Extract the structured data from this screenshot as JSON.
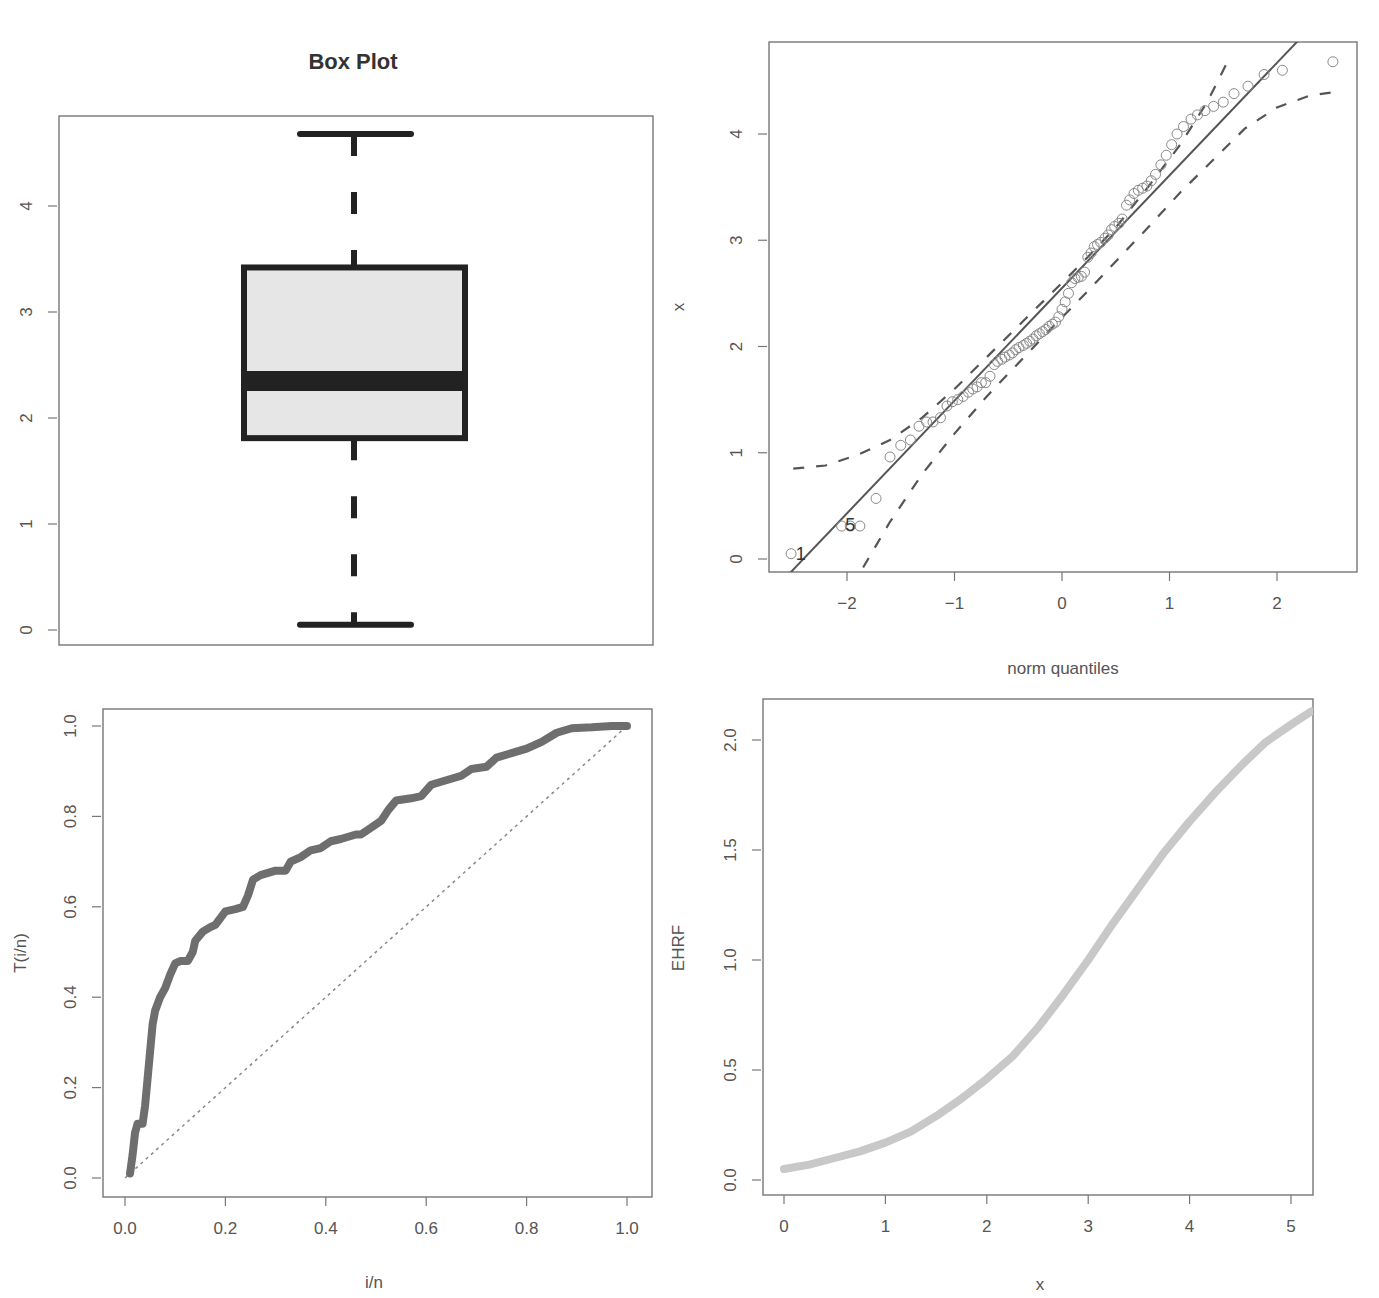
{
  "chart_data": [
    {
      "id": "boxplot",
      "type": "box",
      "title": "Box Plot",
      "xlabel": "",
      "ylabel": "",
      "ylim": [
        -0.1,
        4.9
      ],
      "yticks": [
        0,
        1,
        2,
        3,
        4
      ],
      "ytick_labels": [
        "0",
        "1",
        "2",
        "3",
        "4"
      ],
      "stats": {
        "min": 0.05,
        "q1": 1.81,
        "median": 2.35,
        "q3": 3.42,
        "max": 4.68
      },
      "box_fill": "#e6e6e6",
      "line_color": "#222222",
      "frame": {
        "x0": 59,
        "y0": 116,
        "x1": 653,
        "y1": 645
      },
      "map": {
        "y_px_at_0": 630,
        "px_per_unit": 106
      }
    },
    {
      "id": "qqplot",
      "type": "scatter",
      "title": "",
      "xlabel": "norm quantiles",
      "ylabel": "x",
      "xlim": [
        -2.7,
        2.75
      ],
      "ylim": [
        -0.12,
        4.85
      ],
      "xticks": [
        -2,
        -1,
        0,
        1,
        2
      ],
      "xtick_labels": [
        "−2",
        "−1",
        "0",
        "1",
        "2"
      ],
      "yticks": [
        0,
        1,
        2,
        3,
        4
      ],
      "ytick_labels": [
        "0",
        "1",
        "2",
        "3",
        "4"
      ],
      "point_labels": [
        {
          "text": "1",
          "x": -2.43,
          "y": 0.05
        },
        {
          "text": "5",
          "x": -1.97,
          "y": 0.32
        }
      ],
      "points": [
        [
          -2.52,
          0.05
        ],
        [
          -2.05,
          0.31
        ],
        [
          -1.97,
          0.31
        ],
        [
          -1.88,
          0.31
        ],
        [
          -1.73,
          0.57
        ],
        [
          -1.6,
          0.96
        ],
        [
          -1.5,
          1.07
        ],
        [
          -1.41,
          1.12
        ],
        [
          -1.33,
          1.25
        ],
        [
          -1.26,
          1.29
        ],
        [
          -1.2,
          1.29
        ],
        [
          -1.13,
          1.33
        ],
        [
          -1.07,
          1.44
        ],
        [
          -1.02,
          1.48
        ],
        [
          -0.97,
          1.5
        ],
        [
          -0.92,
          1.53
        ],
        [
          -0.87,
          1.57
        ],
        [
          -0.83,
          1.6
        ],
        [
          -0.79,
          1.62
        ],
        [
          -0.75,
          1.66
        ],
        [
          -0.71,
          1.66
        ],
        [
          -0.67,
          1.72
        ],
        [
          -0.63,
          1.83
        ],
        [
          -0.6,
          1.86
        ],
        [
          -0.56,
          1.88
        ],
        [
          -0.53,
          1.9
        ],
        [
          -0.49,
          1.92
        ],
        [
          -0.46,
          1.94
        ],
        [
          -0.43,
          1.97
        ],
        [
          -0.4,
          1.99
        ],
        [
          -0.36,
          2.01
        ],
        [
          -0.33,
          2.03
        ],
        [
          -0.3,
          2.05
        ],
        [
          -0.27,
          2.07
        ],
        [
          -0.24,
          2.1
        ],
        [
          -0.21,
          2.12
        ],
        [
          -0.18,
          2.14
        ],
        [
          -0.15,
          2.16
        ],
        [
          -0.12,
          2.19
        ],
        [
          -0.09,
          2.21
        ],
        [
          -0.06,
          2.23
        ],
        [
          -0.03,
          2.28
        ],
        [
          0.0,
          2.35
        ],
        [
          0.03,
          2.42
        ],
        [
          0.06,
          2.5
        ],
        [
          0.09,
          2.6
        ],
        [
          0.12,
          2.64
        ],
        [
          0.15,
          2.65
        ],
        [
          0.18,
          2.66
        ],
        [
          0.21,
          2.7
        ],
        [
          0.24,
          2.84
        ],
        [
          0.27,
          2.88
        ],
        [
          0.3,
          2.94
        ],
        [
          0.33,
          2.96
        ],
        [
          0.36,
          2.98
        ],
        [
          0.4,
          3.02
        ],
        [
          0.43,
          3.05
        ],
        [
          0.46,
          3.1
        ],
        [
          0.49,
          3.13
        ],
        [
          0.53,
          3.16
        ],
        [
          0.56,
          3.2
        ],
        [
          0.6,
          3.33
        ],
        [
          0.63,
          3.38
        ],
        [
          0.67,
          3.44
        ],
        [
          0.71,
          3.47
        ],
        [
          0.75,
          3.49
        ],
        [
          0.79,
          3.51
        ],
        [
          0.83,
          3.56
        ],
        [
          0.87,
          3.62
        ],
        [
          0.92,
          3.71
        ],
        [
          0.97,
          3.8
        ],
        [
          1.02,
          3.9
        ],
        [
          1.07,
          4.0
        ],
        [
          1.13,
          4.07
        ],
        [
          1.2,
          4.14
        ],
        [
          1.26,
          4.18
        ],
        [
          1.33,
          4.22
        ],
        [
          1.41,
          4.26
        ],
        [
          1.5,
          4.3
        ],
        [
          1.6,
          4.38
        ],
        [
          1.73,
          4.45
        ],
        [
          1.88,
          4.56
        ],
        [
          2.05,
          4.6
        ],
        [
          2.52,
          4.68
        ]
      ],
      "fit_line": {
        "intercept": 2.55,
        "slope": 1.06
      },
      "upper_band": [
        [
          -2.5,
          0.85
        ],
        [
          -2.2,
          0.88
        ],
        [
          -1.9,
          0.98
        ],
        [
          -1.6,
          1.12
        ],
        [
          -1.3,
          1.33
        ],
        [
          -1.0,
          1.6
        ],
        [
          -0.7,
          1.9
        ],
        [
          -0.4,
          2.2
        ],
        [
          -0.1,
          2.5
        ],
        [
          0.2,
          2.8
        ],
        [
          0.5,
          3.12
        ],
        [
          0.8,
          3.5
        ],
        [
          1.1,
          3.9
        ],
        [
          1.35,
          4.3
        ],
        [
          1.55,
          4.7
        ]
      ],
      "lower_band": [
        [
          -1.85,
          -0.08
        ],
        [
          -1.6,
          0.35
        ],
        [
          -1.3,
          0.8
        ],
        [
          -1.0,
          1.18
        ],
        [
          -0.7,
          1.53
        ],
        [
          -0.4,
          1.85
        ],
        [
          -0.1,
          2.17
        ],
        [
          0.2,
          2.48
        ],
        [
          0.5,
          2.8
        ],
        [
          0.8,
          3.12
        ],
        [
          1.1,
          3.45
        ],
        [
          1.4,
          3.75
        ],
        [
          1.7,
          4.05
        ],
        [
          2.0,
          4.25
        ],
        [
          2.3,
          4.36
        ],
        [
          2.5,
          4.39
        ]
      ],
      "frame": {
        "x0": 769,
        "y0": 42,
        "x1": 1357,
        "y1": 572
      },
      "map": {
        "x_px_at_0": 1062,
        "x_px_per_unit": 107.5,
        "y_px_at_0": 559,
        "y_px_per_unit": 106.25
      }
    },
    {
      "id": "lorenz",
      "type": "line",
      "title": "",
      "xlabel": "i/n",
      "ylabel": "T(i/n)",
      "xlim": [
        -0.04,
        1.04
      ],
      "ylim": [
        -0.04,
        1.04
      ],
      "xticks": [
        0.0,
        0.2,
        0.4,
        0.6,
        0.8,
        1.0
      ],
      "xtick_labels": [
        "0.0",
        "0.2",
        "0.4",
        "0.6",
        "0.8",
        "1.0"
      ],
      "yticks": [
        0.0,
        0.2,
        0.4,
        0.6,
        0.8,
        1.0
      ],
      "ytick_labels": [
        "0.0",
        "0.2",
        "0.4",
        "0.6",
        "0.8",
        "1.0"
      ],
      "series": [
        {
          "name": "T(i/n)",
          "color": "#6e6e6e",
          "points": [
            [
              0.01,
              0.01
            ],
            [
              0.015,
              0.05
            ],
            [
              0.02,
              0.1
            ],
            [
              0.025,
              0.12
            ],
            [
              0.035,
              0.12
            ],
            [
              0.04,
              0.16
            ],
            [
              0.045,
              0.22
            ],
            [
              0.05,
              0.28
            ],
            [
              0.055,
              0.34
            ],
            [
              0.06,
              0.37
            ],
            [
              0.07,
              0.4
            ],
            [
              0.08,
              0.42
            ],
            [
              0.09,
              0.45
            ],
            [
              0.1,
              0.475
            ],
            [
              0.11,
              0.48
            ],
            [
              0.125,
              0.48
            ],
            [
              0.135,
              0.5
            ],
            [
              0.14,
              0.525
            ],
            [
              0.155,
              0.545
            ],
            [
              0.17,
              0.555
            ],
            [
              0.18,
              0.56
            ],
            [
              0.19,
              0.575
            ],
            [
              0.2,
              0.59
            ],
            [
              0.22,
              0.595
            ],
            [
              0.235,
              0.6
            ],
            [
              0.245,
              0.625
            ],
            [
              0.255,
              0.66
            ],
            [
              0.27,
              0.67
            ],
            [
              0.3,
              0.68
            ],
            [
              0.32,
              0.68
            ],
            [
              0.33,
              0.7
            ],
            [
              0.35,
              0.71
            ],
            [
              0.37,
              0.725
            ],
            [
              0.39,
              0.73
            ],
            [
              0.41,
              0.745
            ],
            [
              0.43,
              0.75
            ],
            [
              0.46,
              0.76
            ],
            [
              0.47,
              0.76
            ],
            [
              0.49,
              0.775
            ],
            [
              0.51,
              0.79
            ],
            [
              0.525,
              0.815
            ],
            [
              0.54,
              0.835
            ],
            [
              0.57,
              0.84
            ],
            [
              0.59,
              0.845
            ],
            [
              0.61,
              0.87
            ],
            [
              0.64,
              0.88
            ],
            [
              0.67,
              0.89
            ],
            [
              0.69,
              0.905
            ],
            [
              0.72,
              0.91
            ],
            [
              0.74,
              0.93
            ],
            [
              0.77,
              0.94
            ],
            [
              0.8,
              0.95
            ],
            [
              0.83,
              0.965
            ],
            [
              0.86,
              0.985
            ],
            [
              0.89,
              0.995
            ],
            [
              0.93,
              0.997
            ],
            [
              0.97,
              1.0
            ],
            [
              1.0,
              1.0
            ]
          ]
        },
        {
          "name": "equality",
          "style": "dotted",
          "color": "#888888",
          "points": [
            [
              0,
              0
            ],
            [
              1,
              1
            ]
          ]
        }
      ],
      "frame": {
        "x0": 103,
        "y0": 709,
        "x1": 652,
        "y1": 1197
      },
      "map": {
        "x_px_at_0": 125,
        "x_px_per_unit": 502,
        "y_px_at_0": 1178,
        "y_px_per_unit": 452
      }
    },
    {
      "id": "ehrf",
      "type": "line",
      "title": "",
      "xlabel": "x",
      "ylabel": "EHRF",
      "xlim": [
        -0.2,
        5.2
      ],
      "ylim": [
        -0.08,
        2.2
      ],
      "xticks": [
        0,
        1,
        2,
        3,
        4,
        5
      ],
      "xtick_labels": [
        "0",
        "1",
        "2",
        "3",
        "4",
        "5"
      ],
      "yticks": [
        0.0,
        0.5,
        1.0,
        1.5,
        2.0
      ],
      "ytick_labels": [
        "0.0",
        "0.5",
        "1.0",
        "1.5",
        "2.0"
      ],
      "series": [
        {
          "name": "EHRF",
          "color": "#c8c8c8",
          "points": [
            [
              0.0,
              0.05
            ],
            [
              0.25,
              0.07
            ],
            [
              0.5,
              0.1
            ],
            [
              0.75,
              0.13
            ],
            [
              1.0,
              0.17
            ],
            [
              1.25,
              0.22
            ],
            [
              1.5,
              0.29
            ],
            [
              1.75,
              0.37
            ],
            [
              2.0,
              0.46
            ],
            [
              2.25,
              0.56
            ],
            [
              2.5,
              0.69
            ],
            [
              2.75,
              0.84
            ],
            [
              3.0,
              1.0
            ],
            [
              3.25,
              1.17
            ],
            [
              3.5,
              1.33
            ],
            [
              3.75,
              1.49
            ],
            [
              4.0,
              1.63
            ],
            [
              4.25,
              1.76
            ],
            [
              4.5,
              1.88
            ],
            [
              4.75,
              1.99
            ],
            [
              5.0,
              2.07
            ],
            [
              5.2,
              2.13
            ]
          ]
        }
      ],
      "frame": {
        "x0": 763,
        "y0": 699,
        "x1": 1313,
        "y1": 1195
      },
      "map": {
        "x_px_at_0": 784,
        "x_px_per_unit": 101.4,
        "y_px_at_0": 1180,
        "y_px_per_unit": 220
      }
    }
  ]
}
